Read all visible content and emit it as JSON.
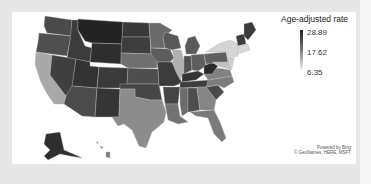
{
  "legend": {
    "title": "Age-adjusted rate",
    "max_label": "28.89",
    "mid_label": "17.62",
    "min_label": "6.35",
    "color_high": "#1f1f1f",
    "color_low": "#f2f2f2"
  },
  "credits": {
    "line1": "Powered by Bing",
    "line2": "© GeoNames, HERE, MSFT"
  },
  "map": {
    "type": "choropleth",
    "region": "United States",
    "shading": "grayscale, darker = higher rate"
  }
}
